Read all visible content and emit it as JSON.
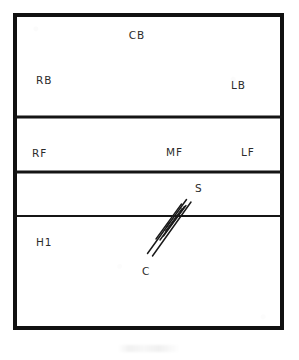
{
  "figure": {
    "background_color": "#ffffff",
    "ink_color": "#151515",
    "frame": {
      "x": 13,
      "y": 13,
      "width": 271,
      "height": 317,
      "border_width": 4
    },
    "dividers": [
      {
        "name": "divider-1",
        "y": 117,
        "thickness": 3.2
      },
      {
        "name": "divider-2",
        "y": 172,
        "thickness": 3.2
      },
      {
        "name": "divider-3",
        "y": 216,
        "thickness": 1.6
      }
    ],
    "bands": [
      {
        "name": "band-upper",
        "labels": [
          "CB",
          "RB",
          "LB"
        ]
      },
      {
        "name": "band-middle",
        "labels": [
          "RF",
          "MF",
          "LF"
        ]
      },
      {
        "name": "band-third",
        "labels": [
          "S"
        ]
      },
      {
        "name": "band-lower",
        "labels": [
          "H1",
          "C"
        ]
      }
    ],
    "labels": [
      {
        "id": "CB",
        "text": "CB",
        "x": 137,
        "y": 39,
        "anchor": "middle"
      },
      {
        "id": "RB",
        "text": "RB",
        "x": 36,
        "y": 84,
        "anchor": "start"
      },
      {
        "id": "LB",
        "text": "LB",
        "x": 231,
        "y": 89,
        "anchor": "start"
      },
      {
        "id": "RF",
        "text": "RF",
        "x": 32,
        "y": 157,
        "anchor": "start"
      },
      {
        "id": "MF",
        "text": "MF",
        "x": 166,
        "y": 156,
        "anchor": "start"
      },
      {
        "id": "LF",
        "text": "LF",
        "x": 241,
        "y": 156,
        "anchor": "start"
      },
      {
        "id": "S",
        "text": "S",
        "x": 195,
        "y": 192,
        "anchor": "start"
      },
      {
        "id": "H1",
        "text": "H1",
        "x": 36,
        "y": 246,
        "anchor": "start"
      },
      {
        "id": "C",
        "text": "C",
        "x": 142,
        "y": 275,
        "anchor": "start"
      }
    ],
    "hatch_band": {
      "name": "diagonal-hatch-band",
      "from": {
        "x": 147,
        "y": 254
      },
      "to": {
        "x": 187,
        "y": 199
      },
      "stroke_count": 6,
      "crosses_divider": "divider-3",
      "endpoint_labels": {
        "upper": "S",
        "lower": "C"
      }
    }
  }
}
